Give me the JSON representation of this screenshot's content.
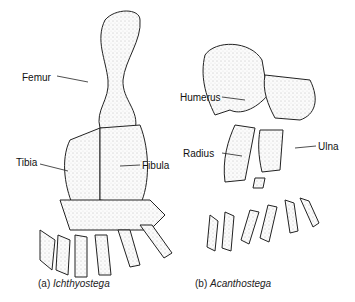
{
  "figure": {
    "panels": [
      {
        "id": "a",
        "caption_prefix": "(a)",
        "caption_name": "Ichthyostega",
        "labels": [
          "Femur",
          "Tibia",
          "Fibula"
        ]
      },
      {
        "id": "b",
        "caption_prefix": "(b)",
        "caption_name": "Acanthostega",
        "labels": [
          "Humerus",
          "Radius",
          "Ulna"
        ]
      }
    ]
  }
}
